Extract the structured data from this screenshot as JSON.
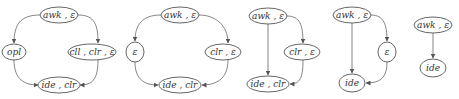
{
  "diagram": {
    "title": "",
    "colors": {
      "stroke": "#555555",
      "text": "#333333",
      "background": "#ffffff"
    },
    "graphs": [
      {
        "nodes": [
          {
            "id": "g1n1",
            "label": "awk , ε",
            "cx": 59,
            "cy": 15,
            "rx": 19,
            "ry": 8
          },
          {
            "id": "g1n2",
            "label": "opl",
            "cx": 14,
            "cy": 52,
            "rx": 12,
            "ry": 8
          },
          {
            "id": "g1n3",
            "label": "cll , clr , ε",
            "cx": 92,
            "cy": 52,
            "rx": 24,
            "ry": 8
          },
          {
            "id": "g1n4",
            "label": "ide , clr",
            "cx": 59,
            "cy": 85,
            "rx": 21,
            "ry": 8
          }
        ],
        "edges": [
          {
            "from": "g1n1",
            "to": "g1n2"
          },
          {
            "from": "g1n1",
            "to": "g1n3"
          },
          {
            "from": "g1n2",
            "to": "g1n4"
          },
          {
            "from": "g1n3",
            "to": "g1n4"
          }
        ]
      },
      {
        "nodes": [
          {
            "id": "g2n1",
            "label": "awk , ε",
            "cx": 180,
            "cy": 15,
            "rx": 19,
            "ry": 8
          },
          {
            "id": "g2n2",
            "label": "ε",
            "cx": 135,
            "cy": 52,
            "rx": 9,
            "ry": 10
          },
          {
            "id": "g2n3",
            "label": "clr , ε",
            "cx": 223,
            "cy": 52,
            "rx": 18,
            "ry": 8
          },
          {
            "id": "g2n4",
            "label": "ide , clr",
            "cx": 180,
            "cy": 85,
            "rx": 21,
            "ry": 8
          }
        ],
        "edges": [
          {
            "from": "g2n1",
            "to": "g2n2"
          },
          {
            "from": "g2n1",
            "to": "g2n3"
          },
          {
            "from": "g2n2",
            "to": "g2n4"
          },
          {
            "from": "g2n3",
            "to": "g2n4"
          }
        ]
      },
      {
        "nodes": [
          {
            "id": "g3n1",
            "label": "awk , ε",
            "cx": 268,
            "cy": 16,
            "rx": 19,
            "ry": 8
          },
          {
            "id": "g3n2",
            "label": "clr , ε",
            "cx": 302,
            "cy": 52,
            "rx": 18,
            "ry": 8
          },
          {
            "id": "g3n3",
            "label": "ide , clr",
            "cx": 268,
            "cy": 84,
            "rx": 21,
            "ry": 8
          }
        ],
        "edges": [
          {
            "from": "g3n1",
            "to": "g3n3"
          },
          {
            "from": "g3n1",
            "to": "g3n2"
          },
          {
            "from": "g3n2",
            "to": "g3n3"
          }
        ]
      },
      {
        "nodes": [
          {
            "id": "g4n1",
            "label": "awk , ε",
            "cx": 352,
            "cy": 15,
            "rx": 19,
            "ry": 8
          },
          {
            "id": "g4n2",
            "label": "ε",
            "cx": 387,
            "cy": 52,
            "rx": 9,
            "ry": 10
          },
          {
            "id": "g4n3",
            "label": "ide",
            "cx": 352,
            "cy": 83,
            "rx": 13,
            "ry": 9
          }
        ],
        "edges": [
          {
            "from": "g4n1",
            "to": "g4n3"
          },
          {
            "from": "g4n1",
            "to": "g4n2"
          },
          {
            "from": "g4n2",
            "to": "g4n3"
          }
        ]
      },
      {
        "nodes": [
          {
            "id": "g5n1",
            "label": "awk , ε",
            "cx": 433,
            "cy": 25,
            "rx": 19,
            "ry": 8
          },
          {
            "id": "g5n2",
            "label": "ide",
            "cx": 433,
            "cy": 68,
            "rx": 13,
            "ry": 9
          }
        ],
        "edges": [
          {
            "from": "g5n1",
            "to": "g5n2"
          }
        ]
      }
    ]
  }
}
